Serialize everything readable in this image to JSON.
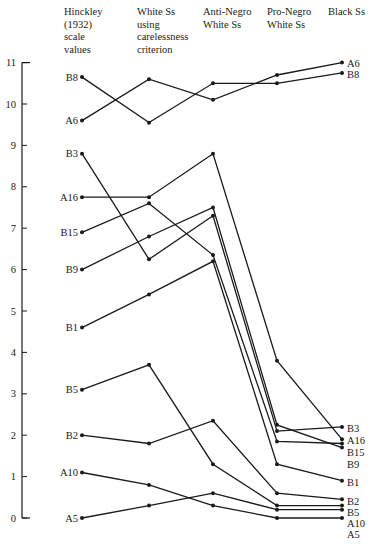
{
  "chart_data": {
    "type": "line",
    "title": "",
    "xlabel": "",
    "ylabel": "",
    "ylim": [
      0,
      11
    ],
    "yticks": [
      0,
      1,
      2,
      3,
      4,
      5,
      6,
      7,
      8,
      9,
      10,
      11
    ],
    "grid": false,
    "legend": "inline labels at left and right ends of lines",
    "categories": [
      "Hinckley (1932) scale values",
      "White Ss using carelessness criterion",
      "Anti-Negro White Ss",
      "Pro-Negro White Ss",
      "Black Ss"
    ],
    "category_labels": [
      "Hinckley\n(1932)\nscale\nvalues",
      "White Ss\nusing\ncarelessness\ncriterion",
      "Anti-Negro\nWhite Ss",
      "Pro-Negro\nWhite Ss",
      "Black Ss"
    ],
    "series": [
      {
        "name": "A6",
        "values": [
          9.6,
          10.6,
          10.1,
          10.7,
          11.0
        ]
      },
      {
        "name": "B8",
        "values": [
          10.65,
          9.55,
          10.5,
          10.5,
          10.75
        ]
      },
      {
        "name": "B3",
        "values": [
          8.8,
          6.25,
          7.3,
          2.1,
          2.2
        ]
      },
      {
        "name": "A16",
        "values": [
          7.75,
          7.75,
          8.8,
          3.8,
          1.9
        ]
      },
      {
        "name": "B15",
        "values": [
          6.9,
          7.6,
          6.35,
          1.85,
          1.8
        ]
      },
      {
        "name": "B9",
        "values": [
          6.0,
          6.8,
          7.5,
          2.25,
          1.7
        ]
      },
      {
        "name": "B1",
        "values": [
          4.6,
          5.4,
          6.2,
          1.3,
          0.9
        ]
      },
      {
        "name": "B5",
        "values": [
          3.1,
          3.7,
          1.3,
          0.3,
          0.3
        ]
      },
      {
        "name": "B2",
        "values": [
          2.0,
          1.8,
          2.35,
          0.6,
          0.45
        ]
      },
      {
        "name": "A10",
        "values": [
          1.1,
          0.8,
          0.3,
          0.0,
          0.0
        ]
      },
      {
        "name": "A5",
        "values": [
          0.0,
          0.3,
          0.6,
          0.2,
          0.2
        ]
      }
    ],
    "right_label_order": [
      "A6",
      "B8",
      "B3",
      "A16",
      "B15",
      "B9",
      "B1",
      "B2",
      "B5",
      "A10",
      "A5"
    ],
    "right_label_y": {
      "A6": 63,
      "B8": 74,
      "B3": 428,
      "A16": 440,
      "B15": 452,
      "B9": 464,
      "B1": 482,
      "B2": 501,
      "B5": 512,
      "A10": 523,
      "A5": 534
    }
  },
  "colors": {
    "line": "#1a1a1a",
    "background": "#ffffff"
  }
}
